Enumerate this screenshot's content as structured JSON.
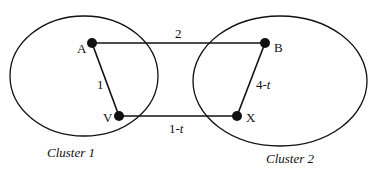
{
  "diagram": {
    "type": "graph",
    "clusters": [
      {
        "id": "c1",
        "label": "Cluster 1",
        "nodes": [
          "A",
          "V"
        ]
      },
      {
        "id": "c2",
        "label": "Cluster 2",
        "nodes": [
          "B",
          "X"
        ]
      }
    ],
    "nodes": [
      {
        "id": "A",
        "label": "A"
      },
      {
        "id": "V",
        "label": "V"
      },
      {
        "id": "B",
        "label": "B"
      },
      {
        "id": "X",
        "label": "X"
      }
    ],
    "edges": [
      {
        "from": "A",
        "to": "B",
        "weight": "2"
      },
      {
        "from": "A",
        "to": "V",
        "weight": "1"
      },
      {
        "from": "B",
        "to": "X",
        "weight_num": "4-",
        "weight_var": "t"
      },
      {
        "from": "V",
        "to": "X",
        "weight_num": "1-",
        "weight_var": "t"
      }
    ],
    "colors": {
      "stroke": "#111111",
      "background": "#ffffff"
    }
  }
}
